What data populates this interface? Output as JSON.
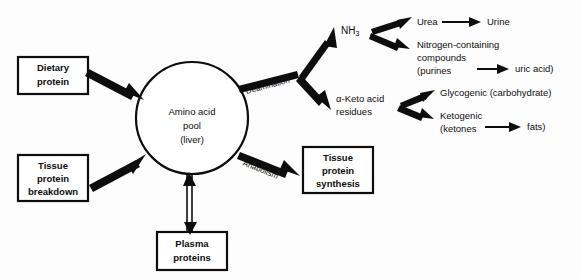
{
  "diagram": {
    "background_color": "#fdfdfd",
    "line_color": "#0d0d0d",
    "nodes": {
      "dietary_protein": {
        "line1": "Dietary",
        "line2": "protein"
      },
      "tissue_protein_breakdown": {
        "line1": "Tissue",
        "line2": "protein",
        "line3": "breakdown"
      },
      "plasma_proteins": {
        "line1": "Plasma",
        "line2": "proteins"
      },
      "amino_acid_pool": {
        "line1": "Amino  acid",
        "line2": "pool",
        "line3": "(liver)"
      },
      "tissue_protein_synthesis": {
        "line1": "Tissue",
        "line2": "protein",
        "line3": "synthesis"
      }
    },
    "process_labels": {
      "catabolism": "Catabolism",
      "anabolism": "Anabolism",
      "deamination": "Deamination"
    },
    "products": {
      "ammonia": "NH",
      "ammonia_subscript": "3",
      "urea": "Urea",
      "urine": "Urine",
      "nitrogen_compounds_line1": "Nitrogen-containing",
      "nitrogen_compounds_line2": "compounds",
      "nitrogen_compounds_line3": "(purines",
      "uric_acid": "uric acid)",
      "keto_acid_line1": "α-Keto acid",
      "keto_acid_line2": "residues",
      "glycogenic": "Glycogenic (carbohydrate)",
      "ketogenic_line1": "Ketogenic",
      "ketogenic_line2": "(ketones",
      "fats": "fats)"
    }
  }
}
